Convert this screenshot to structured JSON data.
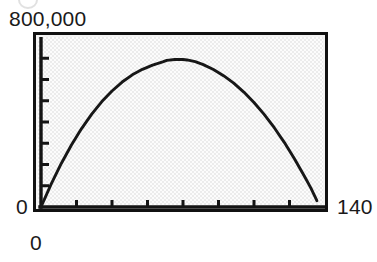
{
  "figure": {
    "kind": "graphing-calculator-plot",
    "background_color": "#ffffff",
    "plot_background_color": "#e9e9e9",
    "frame_color": "#111111",
    "curve_color": "#171717"
  },
  "labels": {
    "y_max": "800,000",
    "y_min": "0",
    "x_min": "0",
    "x_max": "140"
  },
  "chart_data": {
    "type": "line",
    "title": "",
    "xlabel": "",
    "ylabel": "",
    "xlim": [
      0,
      140
    ],
    "ylim": [
      0,
      800000
    ],
    "xtick_labels": [
      "0",
      "140"
    ],
    "ytick_labels": [
      "0",
      "800,000"
    ],
    "x_tick_interval": 17.5,
    "y_tick_interval": 100000,
    "x_tick_values": [
      17.5,
      35,
      52.5,
      70,
      87.5,
      105,
      122.5
    ],
    "y_tick_values": [
      100000,
      200000,
      300000,
      400000,
      500000,
      600000,
      700000
    ],
    "grid": false,
    "legend": null,
    "legend_position": "none",
    "series": [
      {
        "name": "revenue",
        "x": [
          0,
          5,
          10,
          15,
          20,
          25,
          30,
          35,
          40,
          45,
          50,
          55,
          60,
          62,
          66,
          70,
          72,
          76,
          80,
          85,
          90,
          95,
          100,
          105,
          110,
          115,
          120,
          125,
          130,
          133,
          136
        ],
        "y": [
          0,
          108000,
          205000,
          292000,
          369000,
          437000,
          496000,
          546000,
          588000,
          622000,
          648000,
          668000,
          683000,
          690000,
          694000,
          694000,
          692000,
          684000,
          670000,
          647000,
          618000,
          583000,
          541000,
          492000,
          436000,
          373000,
          303000,
          226000,
          142000,
          90000,
          30000
        ]
      }
    ],
    "annotations": []
  }
}
